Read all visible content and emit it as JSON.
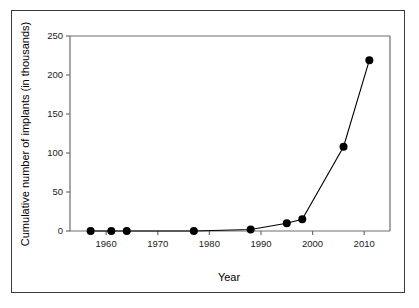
{
  "figure": {
    "frame_color": "#3b3b3b",
    "axis_color": "#6e6e6e",
    "series_color": "#000000",
    "background": "#ffffff"
  },
  "chart_data": {
    "type": "line",
    "title": "",
    "xlabel": "Year",
    "ylabel": "Cumulative number of implants (in thousands)",
    "xlim": [
      1953,
      2015
    ],
    "ylim": [
      0,
      250
    ],
    "xticks": [
      1960,
      1970,
      1980,
      1990,
      2000,
      2010
    ],
    "xticklabels": [
      "1960",
      "1970",
      "1980",
      "1990",
      "2000",
      "2010"
    ],
    "yticks": [
      0,
      50,
      100,
      150,
      200,
      250
    ],
    "yticklabels": [
      "0",
      "50",
      "100",
      "150",
      "200",
      "250"
    ],
    "grid": false,
    "legend": null,
    "marker": "filled-circle",
    "series": [
      {
        "name": "Cumulative implants",
        "x": [
          1957,
          1961,
          1964,
          1977,
          1988,
          1995,
          1998,
          2006,
          2011
        ],
        "values": [
          0,
          0,
          0,
          0,
          2,
          10,
          15,
          108,
          219
        ]
      }
    ]
  }
}
